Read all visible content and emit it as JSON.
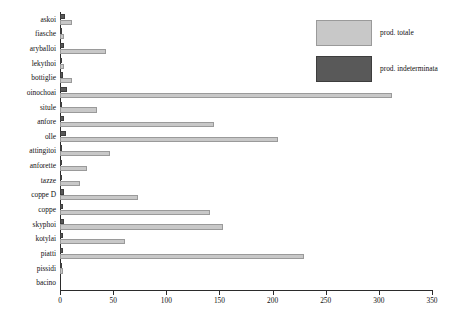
{
  "chart_data": {
    "type": "bar",
    "orientation": "horizontal",
    "title": "",
    "xlabel": "",
    "ylabel": "",
    "xlim": [
      0,
      350
    ],
    "xticks": [
      0,
      50,
      100,
      150,
      200,
      250,
      300,
      350
    ],
    "grid": false,
    "legend_position": "top-right",
    "categories": [
      "askoi",
      "fiasche",
      "aryballoi",
      "lekythoi",
      "bottiglie",
      "oinochoai",
      "situle",
      "anfore",
      "olle",
      "attingitoi",
      "anforette",
      "tazze",
      "coppe D",
      "coppe",
      "skyphoi",
      "kotylai",
      "piatti",
      "pissidi",
      "bacino"
    ],
    "series": [
      {
        "name": "prod. totale",
        "color": "#c8c8c8",
        "values": [
          11,
          4,
          43,
          4,
          11,
          312,
          35,
          145,
          205,
          47,
          25,
          19,
          73,
          141,
          153,
          61,
          230,
          3,
          0
        ]
      },
      {
        "name": "prod. indeterminata",
        "color": "#595959",
        "values": [
          5,
          1,
          4,
          1,
          3,
          7,
          2,
          4,
          6,
          2,
          1,
          2,
          4,
          3,
          4,
          3,
          3,
          1,
          0
        ]
      }
    ]
  },
  "legend": {
    "items": [
      {
        "label": "prod. totale",
        "swatch": "total"
      },
      {
        "label": "prod. indeterminata",
        "swatch": "indet"
      }
    ]
  }
}
